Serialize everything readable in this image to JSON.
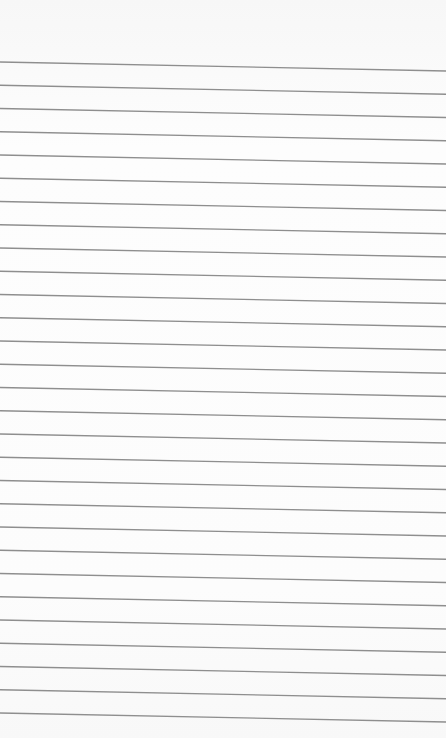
{
  "paper": {
    "background": "#fcfcfc",
    "line_color": "#8e8e8e",
    "line_count": 29,
    "first_line_y_left": 62,
    "line_spacing": 23.25,
    "tilt_right_offset": 9,
    "line_width": 1.3
  }
}
